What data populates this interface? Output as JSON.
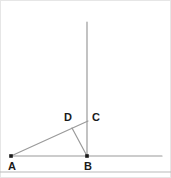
{
  "figure": {
    "canvas": {
      "width": 171,
      "height": 178
    },
    "background_color": "#ffffff",
    "border_color": "#e2e2e2",
    "line_color": "#9a9a9a",
    "point_color": "#1a1a1a",
    "label_color": "#1a1a1a"
  },
  "labels": {
    "a": "A",
    "b": "B",
    "c": "C",
    "d": "D"
  },
  "chart_data": {
    "type": "diagram",
    "title": "",
    "points": [
      {
        "name": "A",
        "x": 11,
        "y": 156,
        "label_x": 8,
        "label_y": 161
      },
      {
        "name": "B",
        "x": 87,
        "y": 156,
        "label_x": 84,
        "label_y": 161
      },
      {
        "name": "C",
        "x": 87,
        "y": 122,
        "label_x": 92,
        "label_y": 112
      },
      {
        "name": "D",
        "x": 72,
        "y": 128,
        "label_x": 64,
        "label_y": 112
      }
    ],
    "segments": [
      {
        "name": "horizontal-ray",
        "x1": 11,
        "y1": 156,
        "x2": 162,
        "y2": 156
      },
      {
        "name": "vertical-ray",
        "x1": 87,
        "y1": 156,
        "x2": 87,
        "y2": 22
      },
      {
        "name": "ray-A-through-D-to-C",
        "x1": 11,
        "y1": 156,
        "x2": 88,
        "y2": 121
      },
      {
        "name": "segment-D-to-B",
        "x1": 72,
        "y1": 128,
        "x2": 87,
        "y2": 156
      }
    ],
    "bottom_rule": {
      "x1": 0,
      "y1": 172,
      "x2": 171,
      "y2": 172
    }
  }
}
